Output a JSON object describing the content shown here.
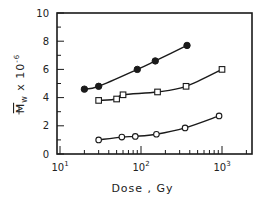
{
  "chart_data": {
    "type": "scatter",
    "title": "",
    "xlabel": "Dose , Gy",
    "ylabel": "Mw x 10^-6",
    "ylabel_parts": {
      "main": "M",
      "sub": "w",
      "mult": " x 10",
      "exp": "-6"
    },
    "xscale": "log",
    "xlim": [
      10,
      2400
    ],
    "ylim": [
      0,
      10
    ],
    "grid": false,
    "legend": null,
    "x_ticks": [
      {
        "value": 10,
        "base": "10",
        "exp": "1"
      },
      {
        "value": 100,
        "base": "10",
        "exp": "2"
      },
      {
        "value": 1000,
        "base": "10",
        "exp": "3"
      }
    ],
    "y_ticks": [
      0,
      2,
      4,
      6,
      8,
      10
    ],
    "series": [
      {
        "name": "filled-circles",
        "marker": "filled-circle",
        "line": "fitted-curve",
        "x": [
          20,
          30,
          90,
          150,
          370
        ],
        "y": [
          4.6,
          4.8,
          6.0,
          6.6,
          7.7
        ]
      },
      {
        "name": "open-squares",
        "marker": "open-square",
        "line": "fitted-curve",
        "x": [
          30,
          50,
          60,
          160,
          360,
          1000
        ],
        "y": [
          3.8,
          3.9,
          4.2,
          4.4,
          4.8,
          6.0
        ]
      },
      {
        "name": "open-circles",
        "marker": "open-circle",
        "line": "fitted-curve",
        "x": [
          30,
          58,
          85,
          155,
          350,
          920
        ],
        "y": [
          1.0,
          1.2,
          1.25,
          1.4,
          1.85,
          2.7
        ]
      }
    ]
  },
  "colors": {
    "ink": "#1a1a1a",
    "background": "#ffffff"
  }
}
